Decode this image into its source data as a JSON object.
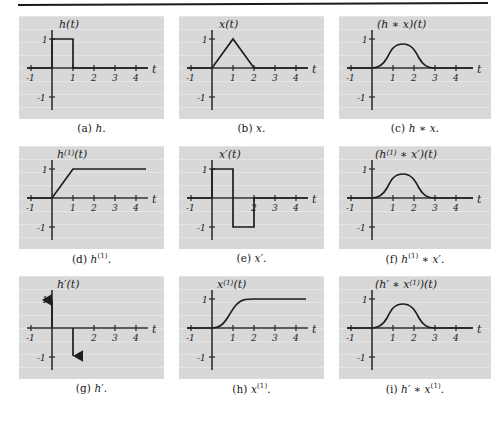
{
  "page": {
    "top_rule": true,
    "background_color": "#ffffff",
    "panel_color": "#d8d8d8",
    "ink_color": "#1d1d22"
  },
  "axes": {
    "x_label": "t",
    "x_ticks": [
      "-1",
      "1",
      "2",
      "3",
      "4"
    ],
    "y_ticks": [
      "1",
      "-1"
    ],
    "x_range": [
      -1.4,
      4.8
    ],
    "y_range": [
      -1.45,
      1.45
    ]
  },
  "panels": [
    {
      "id": "a",
      "caption": "(a) h.",
      "caption_label": "h",
      "y_label": "h(t)",
      "y_label_sup": "",
      "signal": "rect-pulse-0-to-1-height-1"
    },
    {
      "id": "b",
      "caption": "(b) x.",
      "caption_label": "x",
      "y_label": "x(t)",
      "y_label_sup": "",
      "signal": "triangle-0-1-2-peak-1"
    },
    {
      "id": "c",
      "caption": "(c) h * x.",
      "caption_label": "h * x",
      "y_label": "(h * x)(t)",
      "y_label_sup": "",
      "signal": "smooth-bump-0-to-3-peak-0.8-at-1.5"
    },
    {
      "id": "d",
      "caption": "(d) h(1).",
      "caption_label": "h(1)",
      "y_label": "h(1)(t)",
      "y_label_sup": "(1)",
      "signal": "ramp-0-to-1-then-flat-1"
    },
    {
      "id": "e",
      "caption": "(e) x'.",
      "caption_label": "x'",
      "y_label": "x'(t)",
      "y_label_sup": "",
      "signal": "square-plus1-0to1-minus1-1to2"
    },
    {
      "id": "f",
      "caption": "(f) h(1) * x'.",
      "caption_label": "h(1) * x'",
      "y_label": "(h(1) * x')(t)",
      "y_label_sup": "(1)",
      "signal": "smooth-bump-0-to-3-peak-0.8-at-1.5"
    },
    {
      "id": "g",
      "caption": "(g) h'.",
      "caption_label": "h'",
      "y_label": "h'(t)",
      "y_label_sup": "",
      "signal": "impulse-up-at-0-height-1-impulse-down-at-1-height-minus-1"
    },
    {
      "id": "h",
      "caption": "(h) x(1).",
      "caption_label": "x(1)",
      "y_label": "x(1)(t)",
      "y_label_sup": "(1)",
      "signal": "s-curve-rising-0-to-2-saturating-at-1"
    },
    {
      "id": "i",
      "caption": "(i) h' * x(1).",
      "caption_label": "h' * x(1)",
      "y_label": "(h' * x(1))(t)",
      "y_label_sup": "(1)",
      "signal": "smooth-bump-0-to-3-peak-0.8-at-1.5"
    }
  ]
}
